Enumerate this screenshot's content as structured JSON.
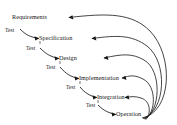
{
  "diagram": {
    "type": "waterfall-lifecycle",
    "background_color": "#ffffff",
    "line_color": "#171717",
    "text_color": "#161616",
    "stages": [
      {
        "id": "requirements",
        "label": "Requirements",
        "x": 57,
        "y": 17
      },
      {
        "id": "specification",
        "label": "Specification",
        "x": 110,
        "y": 38
      },
      {
        "id": "design",
        "label": "Design",
        "x": 90,
        "y": 58
      },
      {
        "id": "implementation",
        "label": "Implementation",
        "x": 157,
        "y": 78
      },
      {
        "id": "integration",
        "label": "Integration",
        "x": 140,
        "y": 97
      },
      {
        "id": "operation",
        "label": "Operation",
        "x": 152,
        "y": 114
      }
    ],
    "transitions": [
      {
        "id": "test-1",
        "label": "Test",
        "from": "requirements",
        "to": "specification"
      },
      {
        "id": "test-2",
        "label": "Test",
        "from": "specification",
        "to": "design"
      },
      {
        "id": "test-3",
        "label": "Test",
        "from": "design",
        "to": "implementation"
      },
      {
        "id": "test-4",
        "label": "Test",
        "from": "implementation",
        "to": "integration"
      },
      {
        "id": "test-5",
        "label": "Test",
        "from": "integration",
        "to": "operation"
      }
    ],
    "feedback_arcs": [
      {
        "id": "feedback-to-requirements",
        "from": "operation",
        "to": "requirements"
      },
      {
        "id": "feedback-to-specification",
        "from": "operation",
        "to": "specification"
      },
      {
        "id": "feedback-to-design",
        "from": "operation",
        "to": "design"
      },
      {
        "id": "feedback-to-implementation",
        "from": "operation",
        "to": "implementation"
      },
      {
        "id": "feedback-to-integration",
        "from": "operation",
        "to": "integration"
      }
    ]
  }
}
